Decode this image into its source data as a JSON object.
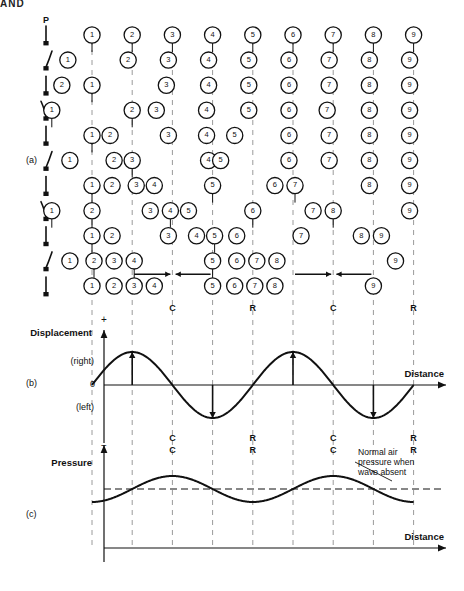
{
  "figure": {
    "corner_fragment": "AND",
    "panels": [
      {
        "id": "a",
        "label": "(a)"
      },
      {
        "id": "b",
        "label": "(b)"
      },
      {
        "id": "c",
        "label": "(c)"
      }
    ]
  },
  "panel_a": {
    "source_label": "P",
    "columns": 9,
    "column_labels": [
      "1",
      "2",
      "3",
      "4",
      "5",
      "6",
      "7",
      "8",
      "9"
    ],
    "rows": [
      {
        "prong": "straight",
        "particles": [
          0,
          1,
          2,
          3,
          4,
          5,
          6,
          7,
          8
        ]
      },
      {
        "prong": "curve-right",
        "particles": [
          -0.6,
          0.9,
          1.9,
          2.9,
          3.9,
          4.9,
          5.9,
          6.9,
          7.9
        ]
      },
      {
        "prong": "straight",
        "particles": [
          0,
          -0.75,
          1.85,
          2.9,
          3.9,
          4.9,
          5.9,
          6.9,
          7.9
        ]
      },
      {
        "prong": "curve-left",
        "particles": [
          -1.0,
          1.0,
          1.6,
          2.85,
          3.9,
          4.9,
          5.85,
          6.9,
          7.9
        ]
      },
      {
        "prong": "straight",
        "particles": [
          0,
          0.45,
          1.9,
          2.85,
          3.55,
          4.9,
          5.9,
          6.9,
          7.9
        ]
      },
      {
        "prong": "curve-right",
        "particles": [
          -0.55,
          0.55,
          1.0,
          2.9,
          3.2,
          4.9,
          5.9,
          6.9,
          7.9
        ]
      },
      {
        "prong": "straight",
        "particles": [
          0,
          0.5,
          1.1,
          1.55,
          3.0,
          4.55,
          5.05,
          6.9,
          7.9
        ]
      },
      {
        "prong": "curve-left",
        "particles": [
          -1.0,
          0.0,
          1.45,
          1.95,
          2.4,
          4.0,
          5.5,
          6.0,
          7.9
        ]
      },
      {
        "prong": "straight",
        "particles": [
          0,
          0.5,
          1.9,
          2.6,
          3.05,
          3.6,
          5.2,
          6.7,
          7.2
        ]
      },
      {
        "prong": "curve-right",
        "particles": [
          -0.55,
          0.05,
          0.55,
          1.05,
          3.0,
          3.6,
          4.1,
          4.6,
          7.55
        ]
      },
      {
        "prong": "straight",
        "particles": [
          0,
          0.55,
          1.05,
          1.55,
          3.0,
          3.55,
          4.05,
          4.55,
          7.0
        ]
      }
    ],
    "compression_rows": [
      {
        "row_index": 9,
        "arrows": [
          {
            "center_column": 2,
            "direction": "right"
          },
          {
            "center_column": 2,
            "direction": "left"
          }
        ]
      },
      {
        "row_index": 9,
        "arrows": [
          {
            "center_column": 6,
            "direction": "right"
          },
          {
            "center_column": 6,
            "direction": "left"
          }
        ]
      }
    ],
    "zone_labels": [
      {
        "text": "C",
        "column": 2
      },
      {
        "text": "R",
        "column": 4
      },
      {
        "text": "C",
        "column": 6
      },
      {
        "text": "R",
        "column": 8
      }
    ]
  },
  "panel_b": {
    "y_axis_label": "Displacement",
    "y_plus": "+",
    "y_minus": "−",
    "y_zero": "0",
    "y_positive_note": "(right)",
    "y_negative_note": "(left)",
    "x_axis_label": "Distance",
    "zone_labels": [
      {
        "text": "C",
        "column": 2
      },
      {
        "text": "R",
        "column": 4
      },
      {
        "text": "C",
        "column": 6
      },
      {
        "text": "R",
        "column": 8
      }
    ],
    "arrows": [
      {
        "column": 1,
        "direction": "up"
      },
      {
        "column": 3,
        "direction": "down"
      },
      {
        "column": 5,
        "direction": "up"
      },
      {
        "column": 7,
        "direction": "down"
      }
    ]
  },
  "panel_c": {
    "y_axis_label": "Pressure",
    "x_axis_label": "Distance",
    "annotation": "Normal air pressure when wave absent",
    "annotation_lines": [
      "Normal air",
      "pressure when",
      "wave absent"
    ],
    "zone_labels": [
      {
        "text": "C",
        "column": 2
      },
      {
        "text": "R",
        "column": 4
      },
      {
        "text": "C",
        "column": 6
      },
      {
        "text": "R",
        "column": 8
      }
    ]
  },
  "chart_data": {
    "type": "line",
    "charts": [
      {
        "id": "displacement",
        "type": "line",
        "title": "Displacement vs Distance",
        "xlabel": "Distance",
        "ylabel": "Displacement",
        "ylim": [
          -1,
          1
        ],
        "ytick_labels": [
          "+",
          "(right)",
          "0",
          "(left)",
          "−"
        ],
        "waveform": "sine",
        "cycles": 2,
        "phase_deg": 0,
        "amplitude": 1,
        "gridlines_at_columns": [
          0,
          1,
          2,
          3,
          4,
          5,
          6,
          7,
          8
        ],
        "annotations": [
          {
            "text": "C",
            "column": 2
          },
          {
            "text": "R",
            "column": 4
          },
          {
            "text": "C",
            "column": 6
          },
          {
            "text": "R",
            "column": 8
          }
        ]
      },
      {
        "id": "pressure",
        "type": "line",
        "title": "Pressure vs Distance",
        "xlabel": "Distance",
        "ylabel": "Pressure",
        "waveform": "cosine",
        "cycles": 2,
        "phase_deg": 180,
        "amplitude": 1,
        "baseline_label": "Normal air pressure when wave absent",
        "annotations": [
          {
            "text": "C",
            "column": 2
          },
          {
            "text": "R",
            "column": 4
          },
          {
            "text": "C",
            "column": 6
          },
          {
            "text": "R",
            "column": 8
          }
        ]
      }
    ]
  },
  "colors": {
    "ink": "#111111",
    "grid": "#9a9a9a",
    "background": "#ffffff"
  }
}
